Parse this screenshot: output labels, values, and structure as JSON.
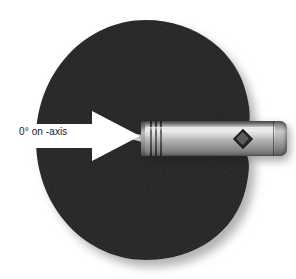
{
  "figure": {
    "type": "microphone-polar-pattern-illustration",
    "background_color": "#ffffff",
    "title": ""
  },
  "polar_pattern": {
    "name": "cardioid-lobe",
    "shape": "cardioid",
    "fill_color": "#232323",
    "edge_color": "#2e2e2e",
    "shadow_color": "#c9c9c9",
    "notch_direction": "left",
    "description": "cardioid pickup lobe"
  },
  "arrow": {
    "name": "on-axis-arrow",
    "label": "0° on -axis",
    "color": "#ffffff",
    "direction": "right",
    "points_to": "microphone capsule"
  },
  "microphone": {
    "name": "pencil-condenser-microphone",
    "body_color": "#c0c0c0",
    "orientation": "horizontal",
    "capsule_end": "left",
    "rings": 3,
    "logo": {
      "name": "diamond-logo-badge",
      "shape": "diamond",
      "color": "#2b2b2b"
    }
  },
  "colors": {
    "background": "#ffffff",
    "lobe": "#232323",
    "arrow": "#ffffff",
    "text": "#1b1b1b",
    "mic_highlight": "#ececec",
    "mic_shadow": "#565656"
  }
}
